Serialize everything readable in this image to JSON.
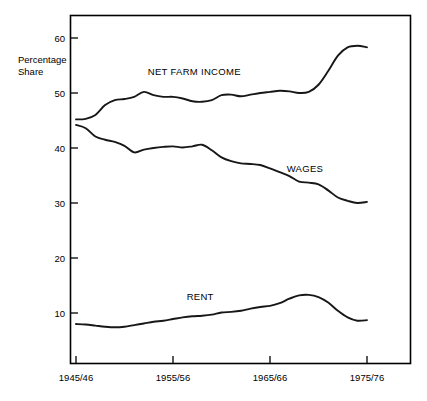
{
  "chart_data": {
    "type": "line",
    "title": "",
    "subtitle": "",
    "xlabel": "",
    "ylabel": "Percentage Share",
    "ylabel_lines": [
      "Percentage",
      "Share"
    ],
    "grid": false,
    "legend_position": "inline-labels",
    "xlim": [
      1945,
      1977
    ],
    "ylim": [
      0,
      63
    ],
    "y_ticks": [
      10,
      20,
      30,
      40,
      50,
      60
    ],
    "y_tick_labels": [
      "10",
      "20",
      "30",
      "40",
      "50",
      "60"
    ],
    "x_ticks": [
      1945,
      1955,
      1965,
      1975
    ],
    "x_tick_labels": [
      "1945/46",
      "1955/56",
      "1965/66",
      "1975/76"
    ],
    "series": [
      {
        "name": "NET FARM INCOME",
        "label": "NET FARM INCOME",
        "label_x": 1957.2,
        "label_y": 53.2,
        "x": [
          1945,
          1946,
          1947,
          1948,
          1949,
          1950,
          1951,
          1952,
          1953,
          1954,
          1955,
          1956,
          1957,
          1958,
          1959,
          1960,
          1961,
          1962,
          1963,
          1964,
          1965,
          1966,
          1967,
          1968,
          1969,
          1970,
          1971,
          1972,
          1973,
          1974,
          1975
        ],
        "values": [
          45.2,
          45.3,
          46.0,
          47.8,
          48.7,
          48.9,
          49.3,
          50.2,
          49.6,
          49.3,
          49.3,
          49.0,
          48.5,
          48.4,
          48.7,
          49.6,
          49.7,
          49.4,
          49.7,
          50.0,
          50.2,
          50.4,
          50.3,
          50.0,
          50.2,
          51.5,
          54.0,
          56.8,
          58.3,
          58.6,
          58.3
        ]
      },
      {
        "name": "WAGES",
        "label": "WAGES",
        "label_x": 1968.6,
        "label_y": 35.6,
        "x": [
          1945,
          1946,
          1947,
          1948,
          1949,
          1950,
          1951,
          1952,
          1953,
          1954,
          1955,
          1956,
          1957,
          1958,
          1959,
          1960,
          1961,
          1962,
          1963,
          1964,
          1965,
          1966,
          1967,
          1968,
          1969,
          1970,
          1971,
          1972,
          1973,
          1974,
          1975
        ],
        "values": [
          44.2,
          43.6,
          42.1,
          41.5,
          41.1,
          40.4,
          39.2,
          39.7,
          40.0,
          40.2,
          40.3,
          40.1,
          40.3,
          40.6,
          39.6,
          38.3,
          37.6,
          37.2,
          37.1,
          36.9,
          36.3,
          35.6,
          34.9,
          33.9,
          33.7,
          33.4,
          32.3,
          31.0,
          30.4,
          30.0,
          30.2
        ]
      },
      {
        "name": "RENT",
        "label": "RENT",
        "label_x": 1957.8,
        "label_y": 12.3,
        "x": [
          1945,
          1946,
          1947,
          1948,
          1949,
          1950,
          1951,
          1952,
          1953,
          1954,
          1955,
          1956,
          1957,
          1958,
          1959,
          1960,
          1961,
          1962,
          1963,
          1964,
          1965,
          1966,
          1967,
          1968,
          1969,
          1970,
          1971,
          1972,
          1973,
          1974,
          1975
        ],
        "values": [
          8.0,
          7.9,
          7.7,
          7.5,
          7.4,
          7.5,
          7.8,
          8.1,
          8.4,
          8.6,
          8.9,
          9.2,
          9.4,
          9.5,
          9.7,
          10.1,
          10.2,
          10.4,
          10.8,
          11.1,
          11.3,
          11.8,
          12.6,
          13.2,
          13.3,
          12.9,
          11.9,
          10.4,
          9.2,
          8.6,
          8.7
        ]
      }
    ]
  }
}
